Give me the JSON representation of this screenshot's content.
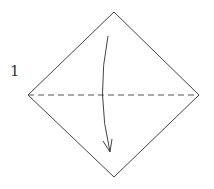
{
  "diagram": {
    "type": "origami-fold-instruction",
    "step_number": "1",
    "shape": "square-diamond",
    "fold_line": "valley-fold-dashed-horizontal",
    "arrow": "fold-top-down",
    "colors": {
      "line": "#444444",
      "background": "#ffffff"
    }
  }
}
